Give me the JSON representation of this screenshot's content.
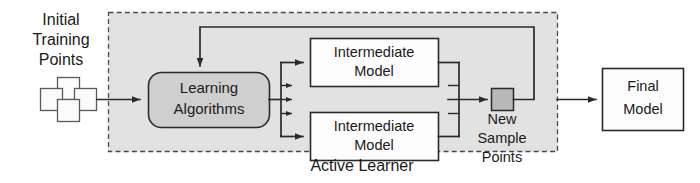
{
  "diagram": {
    "title_label": "Active Learner",
    "nodes": {
      "initial_points": {
        "label_line1": "Initial",
        "label_line2": "Training",
        "label_line3": "Points",
        "icon": "four-squares-cluster-icon"
      },
      "learning_algorithms": {
        "label_line1": "Learning",
        "label_line2": "Algorithms",
        "shape": "rounded-rect",
        "fill": "#cfcfcf"
      },
      "intermediate_model_top": {
        "label_line1": "Intermediate",
        "label_line2": "Model",
        "shape": "rect",
        "fill": "#fdfdfd"
      },
      "intermediate_model_bottom": {
        "label_line1": "Intermediate",
        "label_line2": "Model",
        "shape": "rect",
        "fill": "#fdfdfd"
      },
      "new_sample_points": {
        "label_line1": "New",
        "label_line2": "Sample",
        "label_line3": "Points",
        "icon": "grey-square-icon",
        "fill": "#b9b9b9"
      },
      "final_model": {
        "label_line1": "Final",
        "label_line2": "Model",
        "shape": "rect",
        "fill": "#fdfdfd"
      }
    },
    "panel": {
      "name": "active-learner-boundary",
      "style": "dashed",
      "fill": "#e2e2e2",
      "stroke": "#4a4a4a"
    },
    "edges": [
      {
        "from": "initial_points",
        "to": "learning_algorithms",
        "arrow": true
      },
      {
        "from": "learning_algorithms",
        "to": "intermediate_model_top",
        "arrow": true
      },
      {
        "from": "learning_algorithms",
        "to": "intermediate_model_bottom",
        "arrow": true
      },
      {
        "from": "learning_algorithms",
        "to": "ellipsis_models",
        "arrow": true
      },
      {
        "from": "intermediate_model_top",
        "to": "new_sample_points",
        "arrow": true
      },
      {
        "from": "intermediate_model_bottom",
        "to": "new_sample_points",
        "arrow": true
      },
      {
        "from": "new_sample_points",
        "to": "learning_algorithms",
        "arrow": true,
        "kind": "feedback"
      },
      {
        "from": "new_sample_points",
        "to": "final_model",
        "arrow": true
      }
    ],
    "colors": {
      "ink": "#2a2a2a",
      "panel_fill": "#e2e2e2",
      "node_fill": "#fdfdfd",
      "accent_fill": "#cfcfcf",
      "sample_fill": "#b9b9b9"
    }
  }
}
